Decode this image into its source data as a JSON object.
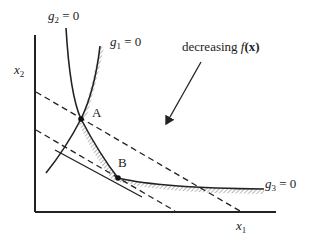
{
  "diagram": {
    "axes": {
      "x_label": "x",
      "x_sub": "1",
      "y_label": "x",
      "y_sub": "2"
    },
    "constraints": [
      {
        "name": "g",
        "sub": "1",
        "eq": " = 0"
      },
      {
        "name": "g",
        "sub": "2",
        "eq": " = 0"
      },
      {
        "name": "g",
        "sub": "3",
        "eq": " = 0"
      }
    ],
    "points": [
      {
        "label": "A"
      },
      {
        "label": "B"
      }
    ],
    "annotation": {
      "text": "decreasing ",
      "f": "f",
      "arg": "(x)"
    },
    "colors": {
      "line": "#222222",
      "hatch": "#888888"
    }
  }
}
